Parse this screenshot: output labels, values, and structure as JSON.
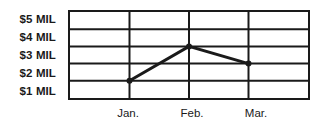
{
  "chart_data": {
    "type": "line",
    "title": "",
    "subtitle": "",
    "xlabel": "",
    "ylabel": "",
    "categories": [
      "Jan.",
      "Feb., ",
      "Mar."
    ],
    "x": [
      "Jan.",
      "Feb.",
      "Mar."
    ],
    "values": [
      2,
      4,
      3
    ],
    "value_labels": [
      "$2 MIL",
      "$4 MIL",
      "$3 MIL"
    ],
    "series": [
      {
        "name": "",
        "values": [
          2,
          4,
          3
        ],
        "color": "#1a1a1a",
        "marker": "dot",
        "line_width": 3
      }
    ],
    "ylim": [
      0,
      5
    ],
    "ytick_values": [
      5,
      4,
      3,
      2,
      1
    ],
    "ytick_labels": [
      "$5 MIL",
      "$4 MIL",
      "$3 MIL",
      "$2 MIL",
      "$1 MIL"
    ],
    "xtick_labels": [
      "Jan.",
      "Feb.",
      "Mar."
    ],
    "grid": true,
    "grid_horizontal": true,
    "grid_vertical": true,
    "legend": false,
    "legend_position": "none",
    "frame": true,
    "colors": {
      "line": "#1a1a1a",
      "grid": "#1a1a1a",
      "frame": "#1a1a1a",
      "background": "#ffffff",
      "text": "#1a1a1a"
    }
  },
  "axes": {
    "y": {
      "ticks": [
        {
          "label": "$5 MIL",
          "value": 5
        },
        {
          "label": "$4 MIL",
          "value": 4
        },
        {
          "label": "$3 MIL",
          "value": 3
        },
        {
          "label": "$2 MIL",
          "value": 2
        },
        {
          "label": "$1 MIL",
          "value": 1
        }
      ]
    },
    "x": {
      "ticks": [
        {
          "label": "Jan.",
          "value": 1
        },
        {
          "label": "Feb.",
          "value": 2
        },
        {
          "label": "Mar.",
          "value": 3
        }
      ]
    }
  }
}
